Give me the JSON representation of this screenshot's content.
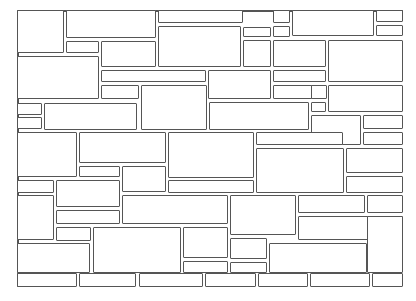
{
  "diagram": {
    "title": "",
    "stroke_color": "#555555",
    "background_color": "#ffffff",
    "frame": {
      "left": 17,
      "top": 10,
      "right": 403,
      "bottom": 287
    },
    "stones": [
      [
        17,
        10,
        47,
        43
      ],
      [
        66,
        10,
        90,
        28
      ],
      [
        66,
        41,
        33,
        12
      ],
      [
        101,
        41,
        55,
        26
      ],
      [
        158,
        10,
        85,
        13
      ],
      [
        158,
        26,
        83,
        41
      ],
      [
        243,
        27,
        28,
        10
      ],
      [
        243,
        40,
        28,
        27
      ],
      [
        273,
        10,
        17,
        13
      ],
      [
        273,
        26,
        17,
        11
      ],
      [
        292,
        10,
        82,
        26
      ],
      [
        376,
        10,
        27,
        12
      ],
      [
        376,
        25,
        27,
        11
      ],
      [
        273,
        40,
        53,
        27
      ],
      [
        328,
        40,
        75,
        42
      ],
      [
        17,
        56,
        82,
        43
      ],
      [
        101,
        70,
        105,
        12
      ],
      [
        101,
        85,
        38,
        14
      ],
      [
        141,
        85,
        66,
        45
      ],
      [
        208,
        70,
        63,
        29
      ],
      [
        273,
        70,
        53,
        12
      ],
      [
        209,
        102,
        100,
        28
      ],
      [
        273,
        85,
        53,
        14
      ],
      [
        311,
        85,
        16,
        14
      ],
      [
        328,
        85,
        75,
        27
      ],
      [
        311,
        102,
        15,
        10
      ],
      [
        311,
        115,
        50,
        30
      ],
      [
        363,
        115,
        40,
        14
      ],
      [
        363,
        132,
        40,
        13
      ],
      [
        17,
        103,
        25,
        12
      ],
      [
        17,
        117,
        25,
        12
      ],
      [
        44,
        103,
        93,
        27
      ],
      [
        17,
        132,
        60,
        45
      ],
      [
        79,
        132,
        87,
        31
      ],
      [
        79,
        166,
        41,
        11
      ],
      [
        122,
        166,
        44,
        26
      ],
      [
        168,
        132,
        86,
        46
      ],
      [
        256,
        148,
        88,
        45
      ],
      [
        256,
        132,
        87,
        13
      ],
      [
        346,
        148,
        57,
        25
      ],
      [
        346,
        176,
        57,
        17
      ],
      [
        168,
        180,
        86,
        13
      ],
      [
        17,
        180,
        37,
        13
      ],
      [
        56,
        180,
        64,
        27
      ],
      [
        17,
        195,
        37,
        45
      ],
      [
        56,
        210,
        64,
        14
      ],
      [
        122,
        195,
        106,
        29
      ],
      [
        230,
        195,
        66,
        40
      ],
      [
        298,
        195,
        67,
        18
      ],
      [
        367,
        195,
        36,
        18
      ],
      [
        298,
        216,
        105,
        24
      ],
      [
        56,
        227,
        35,
        14
      ],
      [
        93,
        227,
        88,
        46
      ],
      [
        183,
        227,
        45,
        31
      ],
      [
        17,
        243,
        73,
        30
      ],
      [
        183,
        261,
        45,
        12
      ],
      [
        230,
        238,
        37,
        21
      ],
      [
        230,
        262,
        37,
        11
      ],
      [
        269,
        243,
        98,
        30
      ],
      [
        367,
        216,
        36,
        57
      ],
      [
        17,
        273,
        60,
        14
      ],
      [
        79,
        273,
        57,
        14
      ],
      [
        139,
        273,
        64,
        14
      ],
      [
        205,
        273,
        51,
        14
      ],
      [
        258,
        273,
        50,
        14
      ],
      [
        310,
        273,
        60,
        14
      ],
      [
        372,
        273,
        31,
        14
      ]
    ]
  }
}
